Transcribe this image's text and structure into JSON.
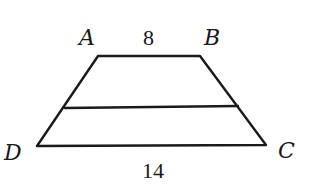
{
  "figure": {
    "type": "trapezoid",
    "vertices": {
      "A": {
        "label": "A",
        "x": 98,
        "y": 56
      },
      "B": {
        "label": "B",
        "x": 200,
        "y": 56
      },
      "C": {
        "label": "C",
        "x": 266,
        "y": 145
      },
      "D": {
        "label": "D",
        "x": 37,
        "y": 146
      }
    },
    "midline": {
      "x1": 65,
      "y1": 108,
      "x2": 238,
      "y2": 106
    },
    "side_labels": {
      "top": "8",
      "bottom": "14"
    },
    "colors": {
      "stroke": "#1a1a1a",
      "background": "#ffffff"
    }
  }
}
